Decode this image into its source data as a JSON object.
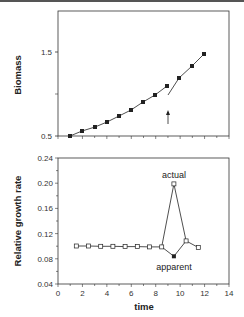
{
  "chart_data": [
    {
      "type": "line",
      "title": "",
      "xlabel": "",
      "ylabel": "Biomass",
      "ylim": [
        0.5,
        2.0
      ],
      "xlim": [
        0,
        14
      ],
      "yticks": [
        "0.5",
        "1.5"
      ],
      "grid": false,
      "series": [
        {
          "name": "biomass",
          "marker": "filled-square",
          "x": [
            1,
            2,
            3,
            4,
            5,
            6,
            7,
            8,
            9,
            10,
            11,
            12
          ],
          "values": [
            0.5,
            0.56,
            0.61,
            0.67,
            0.74,
            0.81,
            0.9,
            0.99,
            1.1,
            1.19,
            1.33,
            1.48
          ]
        }
      ],
      "annotations": [
        {
          "type": "arrow-up",
          "x": 9.1,
          "label": ""
        },
        {
          "type": "discontinuity",
          "x": 9.1,
          "note": "line drops to ~0.99 after point at t=9, then resumes"
        }
      ]
    },
    {
      "type": "line",
      "title": "",
      "xlabel": "time",
      "ylabel": "Relative growth rate",
      "xlim": [
        0,
        14
      ],
      "ylim": [
        0.04,
        0.24
      ],
      "xticks": [
        "0",
        "2",
        "4",
        "6",
        "8",
        "10",
        "12",
        "14"
      ],
      "yticks": [
        "0.04",
        "0.08",
        "0.12",
        "0.16",
        "0.20",
        "0.24"
      ],
      "grid": false,
      "series": [
        {
          "name": "actual",
          "marker": "open-square",
          "x": [
            1.5,
            2.5,
            3.5,
            4.5,
            5.5,
            6.5,
            7.5,
            8.5,
            9.5,
            10.5,
            11.5
          ],
          "values": [
            0.1,
            0.1,
            0.099,
            0.099,
            0.099,
            0.099,
            0.098,
            0.098,
            0.198,
            0.108,
            0.097
          ]
        },
        {
          "name": "apparent",
          "marker": "filled-square",
          "x": [
            8.5,
            9.5,
            10.5
          ],
          "values": [
            0.098,
            0.083,
            0.108
          ]
        }
      ],
      "annotations": [
        {
          "text": "actual",
          "x": 9.5,
          "y": 0.212
        },
        {
          "text": "apparent",
          "x": 9.6,
          "y": 0.072
        }
      ]
    }
  ],
  "top": {
    "ylabel": "Biomass",
    "ytick_15": "1.5",
    "ytick_05": "0.5"
  },
  "bottom": {
    "ylabel": "Relative growth rate",
    "xlabel": "time",
    "yticks": [
      "0.24",
      "0.20",
      "0.16",
      "0.12",
      "0.08",
      "0.04"
    ],
    "xticks": [
      "0",
      "2",
      "4",
      "6",
      "8",
      "10",
      "12",
      "14"
    ],
    "label_actual": "actual",
    "label_apparent": "apparent"
  }
}
